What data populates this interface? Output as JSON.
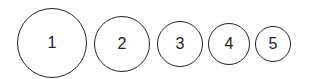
{
  "circles": [
    {
      "label": "1",
      "cx": 52,
      "cy": 43,
      "r": 35
    },
    {
      "label": "2",
      "cx": 122,
      "cy": 44,
      "r": 28
    },
    {
      "label": "3",
      "cx": 180,
      "cy": 44,
      "r": 23
    },
    {
      "label": "4",
      "cx": 229,
      "cy": 44,
      "r": 21
    },
    {
      "label": "5",
      "cx": 273,
      "cy": 44,
      "r": 18
    }
  ]
}
